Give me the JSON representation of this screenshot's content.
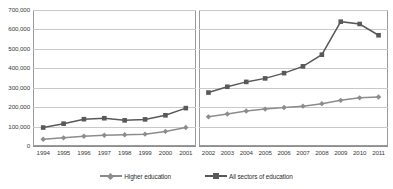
{
  "chart_data": {
    "type": "line",
    "title": "",
    "subtitle": "",
    "xlabel": "",
    "ylabel": "",
    "ylim": [
      0,
      700000
    ],
    "ytick_step": 100000,
    "ytick_labels": [
      "700,000",
      "600,000",
      "500,000",
      "400,000",
      "300,000",
      "200,000",
      "100,000",
      "0"
    ],
    "ytick_values": [
      700000,
      600000,
      500000,
      400000,
      300000,
      200000,
      100000,
      0
    ],
    "grid": true,
    "legend_position": "bottom",
    "axis_break": true,
    "panels": [
      {
        "name": "panel-left",
        "categories": [
          "1994",
          "1995",
          "1996",
          "1997",
          "1998",
          "1999",
          "2000",
          "2001"
        ],
        "series": [
          {
            "name": "Higher education",
            "color": "#8c8c8c",
            "marker": "diamond",
            "values": [
              35000,
              42000,
              50000,
              55000,
              58000,
              61000,
              75000,
              95000
            ]
          },
          {
            "name": "All sectors of education",
            "color": "#595959",
            "marker": "square",
            "values": [
              95000,
              115000,
              138000,
              143000,
              132000,
              137000,
              158000,
              195000
            ]
          }
        ]
      },
      {
        "name": "panel-right",
        "categories": [
          "2002",
          "2003",
          "2004",
          "2005",
          "2006",
          "2007",
          "2008",
          "2009",
          "2010",
          "2011"
        ],
        "series": [
          {
            "name": "Higher education",
            "color": "#8c8c8c",
            "marker": "diamond",
            "values": [
              150000,
              165000,
              180000,
              190000,
              198000,
              205000,
              218000,
              235000,
              248000,
              252000
            ]
          },
          {
            "name": "All sectors of education",
            "color": "#595959",
            "marker": "square",
            "values": [
              275000,
              305000,
              330000,
              348000,
              375000,
              410000,
              470000,
              640000,
              628000,
              570000
            ]
          }
        ]
      }
    ],
    "legend": [
      {
        "label": "Higher education",
        "color": "#8c8c8c",
        "marker": "diamond"
      },
      {
        "label": "All sectors of education",
        "color": "#595959",
        "marker": "square"
      }
    ]
  }
}
